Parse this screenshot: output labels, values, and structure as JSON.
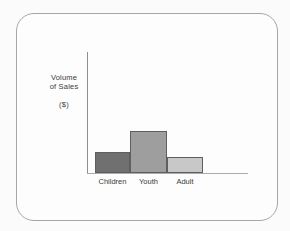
{
  "frame": {
    "background": "#fdfdfd",
    "border_color": "#a6a6a6"
  },
  "chart_data": {
    "type": "bar",
    "title": "",
    "ylabel_lines": [
      "Volume",
      "of Sales"
    ],
    "ylabel_unit": "($)",
    "xlabel": "",
    "categories": [
      "Children",
      "Youth",
      "Adult"
    ],
    "values": [
      21,
      42,
      16
    ],
    "ylim": [
      0,
      121
    ],
    "grid": false,
    "legend": false,
    "axis_color": "#8f8f8f",
    "x_axis_color": "#ababab",
    "bar_colors": [
      "#707070",
      "#9e9e9e",
      "#c8c8c8"
    ],
    "bar_border_color": "#5f5f5f",
    "tick_label_color": "#3b3b3b"
  }
}
